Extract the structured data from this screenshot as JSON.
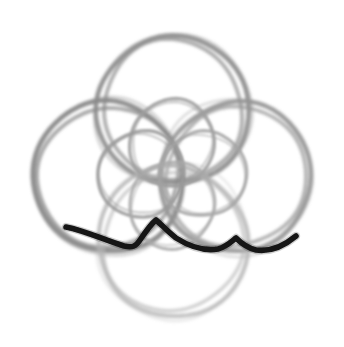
{
  "document": {
    "title": "Hand-drawn quatrefoil rosette sketch",
    "canvas": {
      "width": 344,
      "height": 347,
      "background": "#ffffff"
    }
  },
  "palette": {
    "background": "#ffffff",
    "pencil_light": "#bdbdbd",
    "pencil_mid": "#9a9a9a",
    "pencil_dark": "#808080",
    "ink_black": "#171717"
  },
  "figure": {
    "name": "quatrefoil-rosette",
    "center": {
      "x": 172,
      "y": 174
    }
  },
  "outer_circles": [
    {
      "name": "top-circle",
      "cx": 173,
      "cy": 110,
      "r": 75,
      "stroke": "#8f8f8f",
      "width": 4.6,
      "opacity": 0.95,
      "trace_offset": 5.5
    },
    {
      "name": "left-circle",
      "cx": 108,
      "cy": 177,
      "r": 75,
      "stroke": "#8a8a8a",
      "width": 4.8,
      "opacity": 0.95,
      "trace_offset": 5.0
    },
    {
      "name": "right-circle",
      "cx": 236,
      "cy": 177,
      "r": 75,
      "stroke": "#949494",
      "width": 4.4,
      "opacity": 0.92,
      "trace_offset": 5.2
    },
    {
      "name": "bottom-circle",
      "cx": 173,
      "cy": 242,
      "r": 75,
      "stroke": "#b4b4b4",
      "width": 4.2,
      "opacity": 0.8,
      "trace_offset": 5.5
    }
  ],
  "inner_circles": [
    {
      "name": "inner-top-circle",
      "cx": 172,
      "cy": 143,
      "r": 43,
      "stroke": "#9e9e9e",
      "width": 3.4,
      "opacity": 0.88
    },
    {
      "name": "inner-left-circle",
      "cx": 141,
      "cy": 174,
      "r": 43,
      "stroke": "#9a9a9a",
      "width": 3.4,
      "opacity": 0.88
    },
    {
      "name": "inner-right-circle",
      "cx": 203,
      "cy": 174,
      "r": 43,
      "stroke": "#a3a3a3",
      "width": 3.2,
      "opacity": 0.86
    },
    {
      "name": "inner-bottom-circle",
      "cx": 172,
      "cy": 205,
      "r": 43,
      "stroke": "#a8a8a8",
      "width": 3.2,
      "opacity": 0.84
    }
  ],
  "dark_stroke": {
    "name": "ink-wave-stroke",
    "color": "#171717",
    "width": 5.6,
    "path": "M 66 227 C 86 231 104 240 124 246 C 133 248 136 246 140 240 C 146 231 151 224 156 220 C 162 225 168 232 176 238 C 192 248 206 251 218 249 C 226 247 231 242 236 238 C 241 243 247 248 256 250 C 270 252 284 246 296 236"
  },
  "render": {
    "jitter_seed": 7,
    "texture": "pencil"
  }
}
